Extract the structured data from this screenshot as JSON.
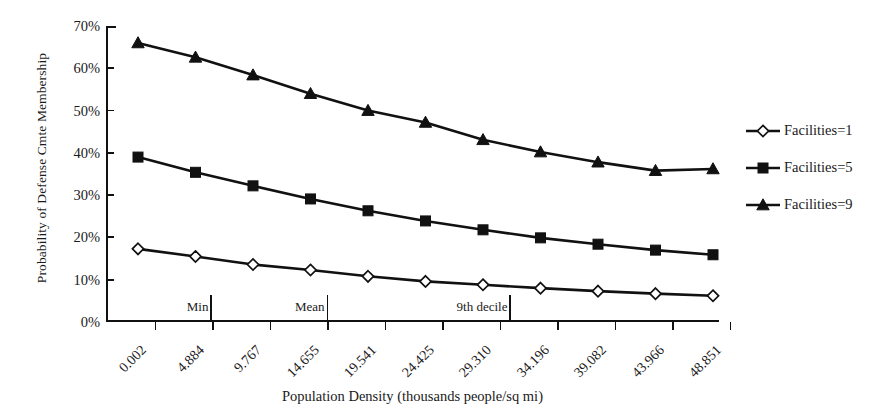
{
  "chart_data": {
    "type": "line",
    "title": "",
    "xlabel": "Population Density (thousands people/sq mi)",
    "ylabel": "Probability of Defense Cmte Membership",
    "categories": [
      "0.002",
      "4.884",
      "9.767",
      "14.655",
      "19.541",
      "24.425",
      "29.310",
      "34.196",
      "39.082",
      "43.966",
      "48.851"
    ],
    "ytick_labels": [
      "0%",
      "10%",
      "20%",
      "30%",
      "40%",
      "50%",
      "60%",
      "70%"
    ],
    "ytick_values": [
      0,
      10,
      20,
      30,
      40,
      50,
      60,
      70
    ],
    "ylim": [
      0,
      70
    ],
    "grid": false,
    "legend_position": "right",
    "series": [
      {
        "name": "Facilities=1",
        "marker": "diamond-open",
        "values": [
          17.3,
          15.5,
          13.6,
          12.3,
          10.8,
          9.6,
          8.8,
          8.0,
          7.3,
          6.7,
          6.2
        ]
      },
      {
        "name": "Facilities=5",
        "marker": "square-filled",
        "values": [
          39.0,
          35.4,
          32.2,
          29.1,
          26.3,
          23.9,
          21.8,
          19.9,
          18.4,
          17.0,
          15.9
        ]
      },
      {
        "name": "Facilities=9",
        "marker": "triangle-filled",
        "values": [
          66.0,
          62.6,
          58.4,
          54.0,
          50.0,
          47.2,
          43.1,
          40.2,
          37.8,
          35.8,
          36.2
        ]
      }
    ],
    "annotations": [
      {
        "label": "Min",
        "x_index": 0.97
      },
      {
        "label": "Mean",
        "x_index": 2.99
      },
      {
        "label": "9th decile",
        "x_index": 6.17
      }
    ]
  },
  "legend": {
    "items": [
      {
        "label": "Facilities=1"
      },
      {
        "label": "Facilities=5"
      },
      {
        "label": "Facilities=9"
      }
    ]
  }
}
